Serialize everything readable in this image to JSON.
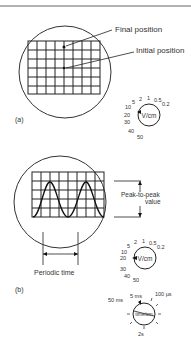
{
  "figure_a": {
    "panel_label": "(a)",
    "annotations": [
      "Final position",
      "Initial position"
    ],
    "dial": {
      "unit": "V/cm",
      "scale_labels": [
        "1",
        "0.5",
        "0.2",
        "2",
        "5",
        "10",
        "20",
        "30",
        "40",
        "50"
      ],
      "selected": "20"
    }
  },
  "figure_b": {
    "panel_label": "(b)",
    "annotations": [
      "Peak-to-peak",
      "value",
      "Periodic time"
    ],
    "volts_dial": {
      "unit": "V/cm",
      "scale_labels": [
        "1",
        "0.5",
        "0.2",
        "2",
        "5",
        "10",
        "20",
        "30",
        "40",
        "50"
      ],
      "selected": "20"
    },
    "time_dial": {
      "unit": "time/cm",
      "scale_labels": [
        "5 ms",
        "100 µs",
        "50 ms",
        "2s"
      ]
    }
  }
}
